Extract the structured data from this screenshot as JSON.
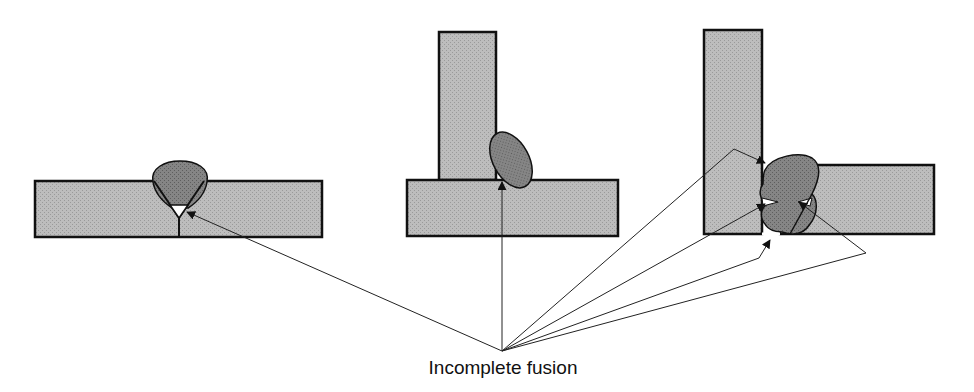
{
  "diagram": {
    "caption": "Incomplete fusion",
    "colors": {
      "plate_fill": "#b4b4b4",
      "weld_fill": "#7c7c7c",
      "outline": "#111111",
      "leader": "#222222",
      "background": "#ffffff"
    },
    "joints": [
      {
        "name": "butt-joint-single-v",
        "defect_points": 1
      },
      {
        "name": "t-joint-fillet",
        "defect_points": 1
      },
      {
        "name": "corner-joint-double-weld",
        "defect_points": 4
      }
    ],
    "leader_origin": {
      "x": 502,
      "y": 351
    }
  }
}
